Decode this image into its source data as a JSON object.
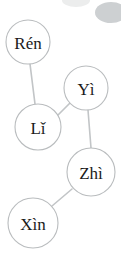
{
  "diagram": {
    "type": "node-link-graph",
    "title": "",
    "background_color": "#ffffff",
    "node_fill_color": "#ffffff",
    "node_stroke_color": "#b9bcbe",
    "edge_color": "#c2c5c7",
    "label_color": "#1a1a1a",
    "nodes": [
      {
        "id": "ren",
        "label": "Rén",
        "cx": 28,
        "cy": 42,
        "r": 22
      },
      {
        "id": "yi",
        "label": "Yì",
        "cx": 86,
        "cy": 88,
        "r": 22
      },
      {
        "id": "li",
        "label": "Lǐ",
        "cx": 38,
        "cy": 127,
        "r": 23
      },
      {
        "id": "zhi",
        "label": "Zhì",
        "cx": 91,
        "cy": 172,
        "r": 24
      },
      {
        "id": "xin",
        "label": "Xìn",
        "cx": 33,
        "cy": 223,
        "r": 25
      }
    ],
    "edges": [
      {
        "id": "edge-ren-li",
        "source": "ren",
        "target": "li",
        "x1": 30,
        "y1": 64,
        "x2": 35,
        "y2": 104
      },
      {
        "id": "edge-li-yi",
        "source": "li",
        "target": "yi",
        "x1": 57,
        "y1": 116,
        "x2": 70,
        "y2": 103
      },
      {
        "id": "edge-yi-zhi",
        "source": "yi",
        "target": "zhi",
        "x1": 88,
        "y1": 110,
        "x2": 91,
        "y2": 148
      },
      {
        "id": "edge-zhi-xin",
        "source": "zhi",
        "target": "xin",
        "x1": 72,
        "y1": 189,
        "x2": 52,
        "y2": 206
      }
    ],
    "decorations": [
      {
        "id": "blob-top-left",
        "shape": "ellipse",
        "color": "#eceded",
        "left": 62,
        "top": -6,
        "width": 28,
        "height": 13
      },
      {
        "id": "blob-top-right",
        "shape": "ellipse",
        "color": "#cdd0d2",
        "left": 95,
        "top": 2,
        "width": 32,
        "height": 21
      }
    ]
  }
}
